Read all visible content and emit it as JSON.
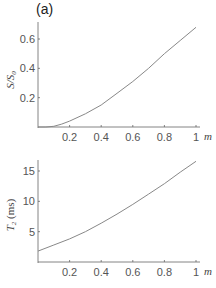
{
  "figure": {
    "panel_label": "(a)"
  },
  "chart_data": [
    {
      "type": "line",
      "title": "",
      "xlabel": "m",
      "ylabel": "S/S0",
      "xlim": [
        0,
        1
      ],
      "ylim": [
        0,
        0.7
      ],
      "x_ticks": [
        "0.2",
        "0.4",
        "0.6",
        "0.8",
        "1"
      ],
      "y_ticks": [
        "0.2",
        "0.4",
        "0.6"
      ],
      "grid": false,
      "series": [
        {
          "name": "S/S0",
          "x": [
            0.0,
            0.05,
            0.1,
            0.15,
            0.2,
            0.3,
            0.4,
            0.5,
            0.6,
            0.7,
            0.8,
            0.9,
            1.0
          ],
          "y": [
            0.0,
            0.0,
            0.005,
            0.02,
            0.04,
            0.09,
            0.15,
            0.23,
            0.31,
            0.4,
            0.5,
            0.59,
            0.68
          ]
        }
      ]
    },
    {
      "type": "line",
      "title": "",
      "xlabel": "m",
      "ylabel": "T2 (ms)",
      "xlim": [
        0,
        1
      ],
      "ylim": [
        0,
        17
      ],
      "x_ticks": [
        "0.2",
        "0.4",
        "0.6",
        "0.8",
        "1"
      ],
      "y_ticks": [
        "5",
        "10",
        "15"
      ],
      "grid": false,
      "series": [
        {
          "name": "T2",
          "x": [
            0.0,
            0.1,
            0.2,
            0.3,
            0.4,
            0.5,
            0.6,
            0.7,
            0.8,
            0.9,
            1.0
          ],
          "y": [
            1.8,
            2.8,
            3.8,
            5.0,
            6.4,
            7.9,
            9.5,
            11.2,
            12.9,
            14.8,
            16.6
          ]
        }
      ]
    }
  ]
}
